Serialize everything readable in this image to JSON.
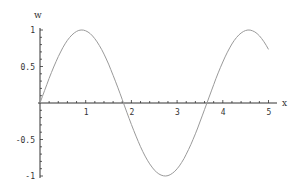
{
  "chart_data": {
    "type": "line",
    "title": "",
    "xlabel": "x",
    "ylabel": "w",
    "xlim": [
      0,
      5.2
    ],
    "ylim": [
      -1,
      1
    ],
    "grid": false,
    "legend": null,
    "x_ticks": [
      "1",
      "2",
      "3",
      "4",
      "5"
    ],
    "y_ticks": [
      "1",
      "0.5",
      "-0.5",
      "-1"
    ],
    "series": [
      {
        "name": "w",
        "description": "sine wave, approx w = sin(1.72 x)",
        "color": "#9a9a9a",
        "x": [
          0,
          0.25,
          0.5,
          0.75,
          0.91,
          1.0,
          1.25,
          1.5,
          1.75,
          1.83,
          2.0,
          2.25,
          2.5,
          2.74,
          3.0,
          3.25,
          3.5,
          3.65,
          3.75,
          4.0,
          4.25,
          4.57,
          4.75,
          5.0
        ],
        "y": [
          0,
          0.42,
          0.76,
          0.96,
          1.0,
          0.99,
          0.84,
          0.53,
          0.13,
          0.0,
          -0.3,
          -0.68,
          -0.93,
          -1.0,
          -0.91,
          -0.62,
          -0.22,
          0.0,
          0.16,
          0.58,
          0.89,
          1.0,
          0.96,
          0.74
        ]
      }
    ]
  }
}
